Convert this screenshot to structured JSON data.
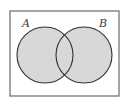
{
  "diagram": {
    "type": "venn",
    "frame": {
      "x": 10,
      "y": 11,
      "width": 109,
      "height": 85,
      "stroke": "#6a6a6a"
    },
    "sets": [
      {
        "label": "A",
        "cx": 45,
        "cy": 55,
        "r": 28,
        "label_x": 26,
        "label_y": 27
      },
      {
        "label": "B",
        "cx": 84,
        "cy": 55,
        "r": 28,
        "label_x": 103,
        "label_y": 27
      }
    ],
    "shading": {
      "region": "A ∪ B",
      "fill": "#d8d8d8",
      "stroke": "#333333"
    }
  }
}
